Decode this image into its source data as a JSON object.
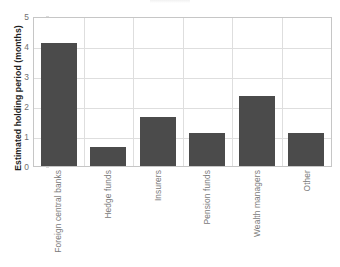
{
  "chart_data": {
    "type": "bar",
    "title": "",
    "xlabel": "",
    "ylabel": "Estimated holding period (months)",
    "categories": [
      "Foreign central banks",
      "Hedge funds",
      "Insurers",
      "Pension funds",
      "Wealth managers",
      "Other"
    ],
    "values": [
      4.1,
      0.63,
      1.65,
      1.1,
      2.33,
      1.1
    ],
    "ylim": [
      0,
      5
    ],
    "yticks": [
      0,
      1,
      2,
      3,
      4,
      5
    ],
    "ytick_labels": [
      "0",
      "1",
      "2",
      "3",
      "4",
      "5"
    ],
    "grid": true,
    "legend": "none",
    "bar_color": "#4b4b4b",
    "gridline_color": "#dedede",
    "axis_color": "#c6c6c6"
  },
  "axes": {
    "y_title": "Estimated holding period (months)"
  }
}
